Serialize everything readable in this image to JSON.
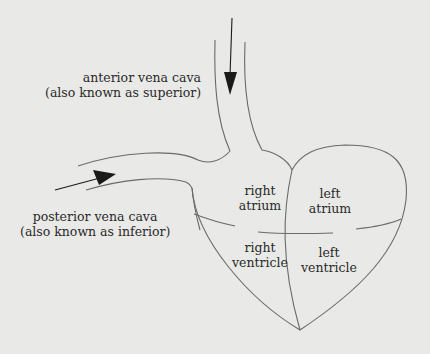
{
  "diagram": {
    "colors": {
      "background": "#e9e9e7",
      "line": "#6a6a6a",
      "text": "#2a2a2a",
      "arrow": "#1a1a1a"
    },
    "labels": {
      "anterior": {
        "line1": "anterior vena cava",
        "line2": "(also known as superior)"
      },
      "posterior": {
        "line1": "posterior vena cava",
        "line2": "(also known as inferior)"
      },
      "right_atrium": {
        "line1": "right",
        "line2": "atrium"
      },
      "left_atrium": {
        "line1": "left",
        "line2": "atrium"
      },
      "right_ventricle": {
        "line1": "right",
        "line2": "ventricle"
      },
      "left_ventricle": {
        "line1": "left",
        "line2": "ventricle"
      }
    },
    "arrows": [
      {
        "name": "superior-flow",
        "direction": "down"
      },
      {
        "name": "inferior-flow",
        "direction": "right"
      }
    ]
  }
}
